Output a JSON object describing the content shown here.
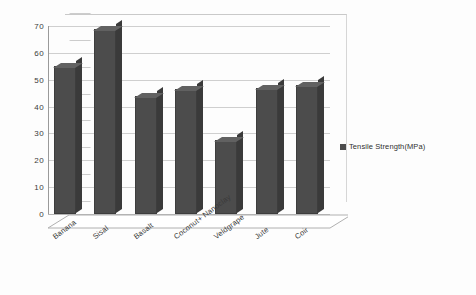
{
  "chart_data": {
    "type": "bar",
    "title": "",
    "subtitle": "",
    "xlabel": "",
    "ylabel": "",
    "categories": [
      "Banana",
      "Sisal",
      "Basalt",
      "Coconut+ Nanoclay",
      "Veldgrape",
      "Jute",
      "Coir"
    ],
    "series": [
      {
        "name": "Tensile Strength(MPa)",
        "color": "#4c4c4c",
        "values": [
          55,
          69,
          44,
          46.5,
          27.5,
          47,
          48
        ]
      }
    ],
    "ylim": [
      0,
      70
    ],
    "yticks": [
      0,
      10,
      20,
      30,
      40,
      50,
      60,
      70
    ],
    "ytick_labels": [
      "0",
      "10",
      "20",
      "30",
      "40",
      "50",
      "60",
      "70"
    ],
    "grid": true,
    "legend_position": "right",
    "style": "3d-column",
    "background": "#ffffff",
    "gridline_color": "#cfcfcf",
    "axis_color": "#9a9a9a"
  },
  "legend": {
    "entries": [
      {
        "label": "Tensile Strength(MPa)",
        "color": "#4c4c4c"
      }
    ]
  }
}
